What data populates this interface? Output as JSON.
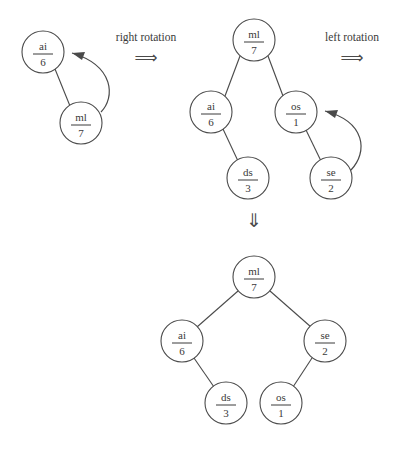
{
  "diagram": {
    "type": "binary-tree-rotation",
    "background_color": "#ffffff",
    "stroke_color": "#4a4a4a",
    "text_color": "#3a3a3a",
    "labels": {
      "right_rotation": "right rotation",
      "left_rotation": "left rotation",
      "implies_arrow": "⟹",
      "down_arrow": "⇓"
    },
    "stages": [
      {
        "name": "initial-tree",
        "nodes": [
          {
            "id": "ai",
            "key": "ai",
            "value": "6",
            "cx": 43,
            "cy": 52,
            "r": 21
          },
          {
            "id": "ml",
            "key": "ml",
            "value": "7",
            "cx": 81,
            "cy": 123,
            "r": 21
          }
        ],
        "edges": [
          {
            "from": "ai",
            "to": "ml"
          }
        ],
        "rotation_arc": {
          "from": "ml",
          "to": "ai",
          "direction": "counter-clockwise"
        }
      },
      {
        "name": "middle-tree",
        "nodes": [
          {
            "id": "ml",
            "key": "ml",
            "value": "7",
            "cx": 254,
            "cy": 40,
            "r": 21
          },
          {
            "id": "ai",
            "key": "ai",
            "value": "6",
            "cx": 211,
            "cy": 112,
            "r": 21
          },
          {
            "id": "os",
            "key": "os",
            "value": "1",
            "cx": 296,
            "cy": 112,
            "r": 21
          },
          {
            "id": "ds",
            "key": "ds",
            "value": "3",
            "cx": 248,
            "cy": 178,
            "r": 21
          },
          {
            "id": "se",
            "key": "se",
            "value": "2",
            "cx": 331,
            "cy": 178,
            "r": 21
          }
        ],
        "edges": [
          {
            "from": "ml",
            "to": "ai"
          },
          {
            "from": "ml",
            "to": "os"
          },
          {
            "from": "ai",
            "to": "ds"
          },
          {
            "from": "os",
            "to": "se"
          }
        ],
        "rotation_arc": {
          "from": "se",
          "to": "os",
          "direction": "counter-clockwise"
        }
      },
      {
        "name": "final-tree",
        "nodes": [
          {
            "id": "ml",
            "key": "ml",
            "value": "7",
            "cx": 254,
            "cy": 277,
            "r": 21
          },
          {
            "id": "ai",
            "key": "ai",
            "value": "6",
            "cx": 182,
            "cy": 341,
            "r": 21
          },
          {
            "id": "se",
            "key": "se",
            "value": "2",
            "cx": 325,
            "cy": 341,
            "r": 21
          },
          {
            "id": "ds",
            "key": "ds",
            "value": "3",
            "cx": 226,
            "cy": 403,
            "r": 21
          },
          {
            "id": "os",
            "key": "os",
            "value": "1",
            "cx": 281,
            "cy": 403,
            "r": 21
          }
        ],
        "edges": [
          {
            "from": "ml",
            "to": "ai"
          },
          {
            "from": "ml",
            "to": "se"
          },
          {
            "from": "ai",
            "to": "ds"
          },
          {
            "from": "se",
            "to": "os"
          }
        ],
        "rotation_arc": null
      }
    ],
    "annotations": [
      {
        "id": "right-rotation",
        "text": "right rotation",
        "x": 104,
        "y": 38,
        "width": 80
      },
      {
        "id": "left-rotation",
        "text": "left rotation",
        "x": 312,
        "y": 38,
        "width": 80
      }
    ]
  }
}
